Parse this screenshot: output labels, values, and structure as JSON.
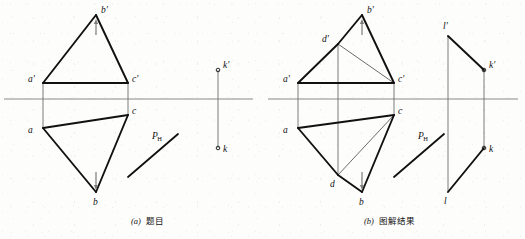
{
  "figure": {
    "type": "descriptive-geometry-projection",
    "width": 525,
    "height": 239,
    "background_color": "#fdfdfc",
    "line_color": "#111111",
    "axis_color": "#8a8a8a",
    "thin_line_color": "#5a5a5a",
    "panels": [
      {
        "id": "panel-a",
        "caption_index": "(a)",
        "caption_text": "题目",
        "caption_position": {
          "x": 131,
          "y": 224
        },
        "ground_line": {
          "x1": 4,
          "y1": 99,
          "x2": 253,
          "y2": 99
        },
        "points": [
          {
            "name": "a-prime",
            "label": "a'",
            "x": 43,
            "y": 83,
            "label_x": 28,
            "label_y": 82,
            "marker": "none"
          },
          {
            "name": "b-prime",
            "label": "b'",
            "x": 96,
            "y": 15,
            "label_x": 101,
            "label_y": 13,
            "marker": "none"
          },
          {
            "name": "c-prime",
            "label": "c'",
            "x": 128,
            "y": 83,
            "label_x": 132,
            "label_y": 82,
            "marker": "none"
          },
          {
            "name": "a",
            "label": "a",
            "x": 43,
            "y": 128,
            "label_x": 28,
            "label_y": 133,
            "marker": "none"
          },
          {
            "name": "b",
            "label": "b",
            "x": 96,
            "y": 192,
            "label_x": 93,
            "label_y": 205,
            "marker": "none"
          },
          {
            "name": "c",
            "label": "c",
            "x": 128,
            "y": 115,
            "label_x": 132,
            "label_y": 114,
            "marker": "none"
          },
          {
            "name": "k-prime",
            "label": "k'",
            "x": 218,
            "y": 70,
            "label_x": 223,
            "label_y": 68,
            "marker": "circle"
          },
          {
            "name": "k",
            "label": "k",
            "x": 218,
            "y": 148,
            "label_x": 223,
            "label_y": 152,
            "marker": "circle"
          }
        ],
        "thick_edges": [
          {
            "name": "edge-a-prime-b-prime",
            "from": "a-prime",
            "to": "b-prime"
          },
          {
            "name": "edge-b-prime-c-prime",
            "from": "b-prime",
            "to": "c-prime"
          },
          {
            "name": "edge-a-prime-c-prime",
            "from": "a-prime",
            "to": "c-prime"
          },
          {
            "name": "edge-a-b",
            "from": "a",
            "to": "b"
          },
          {
            "name": "edge-b-c",
            "from": "b",
            "to": "c"
          },
          {
            "name": "edge-a-c",
            "from": "a",
            "to": "c"
          }
        ],
        "projection_lines": [
          {
            "name": "projector-a",
            "x1": 43,
            "y1": 83,
            "x2": 43,
            "y2": 128
          },
          {
            "name": "projector-c",
            "x1": 128,
            "y1": 83,
            "x2": 128,
            "y2": 115
          },
          {
            "name": "projector-k",
            "x1": 218,
            "y1": 70,
            "x2": 218,
            "y2": 148
          }
        ],
        "arrows": [
          {
            "name": "arrow-b-prime",
            "x1": 96,
            "y1": 35,
            "x2": 96,
            "y2": 19
          },
          {
            "name": "arrow-b",
            "x1": 96,
            "y1": 172,
            "x2": 96,
            "y2": 190
          }
        ],
        "trace_line": {
          "name": "trace-ph",
          "x1": 128,
          "y1": 177,
          "x2": 178,
          "y2": 134,
          "label_main": "P",
          "label_sub": "H",
          "label_x": 152,
          "label_y": 139
        }
      },
      {
        "id": "panel-b",
        "caption_index": "(b)",
        "caption_text": "图解结果",
        "caption_position": {
          "x": 364,
          "y": 224
        },
        "ground_line": {
          "x1": 268,
          "y1": 99,
          "x2": 518,
          "y2": 99
        },
        "points": [
          {
            "name": "a-prime",
            "label": "a'",
            "x": 298,
            "y": 83,
            "label_x": 283,
            "label_y": 82,
            "marker": "none"
          },
          {
            "name": "b-prime",
            "label": "b'",
            "x": 362,
            "y": 15,
            "label_x": 367,
            "label_y": 13,
            "marker": "none"
          },
          {
            "name": "c-prime",
            "label": "c'",
            "x": 394,
            "y": 83,
            "label_x": 398,
            "label_y": 82,
            "marker": "none"
          },
          {
            "name": "d-prime",
            "label": "d'",
            "x": 338,
            "y": 44,
            "label_x": 322,
            "label_y": 42,
            "marker": "none"
          },
          {
            "name": "a",
            "label": "a",
            "x": 298,
            "y": 128,
            "label_x": 283,
            "label_y": 133,
            "marker": "none"
          },
          {
            "name": "b",
            "label": "b",
            "x": 362,
            "y": 192,
            "label_x": 359,
            "label_y": 205,
            "marker": "none"
          },
          {
            "name": "c",
            "label": "c",
            "x": 394,
            "y": 115,
            "label_x": 398,
            "label_y": 114,
            "marker": "none"
          },
          {
            "name": "d",
            "label": "d",
            "x": 338,
            "y": 175,
            "label_x": 330,
            "label_y": 187,
            "marker": "none"
          },
          {
            "name": "l-prime",
            "label": "l'",
            "x": 448,
            "y": 36,
            "label_x": 443,
            "label_y": 29,
            "marker": "none"
          },
          {
            "name": "k-prime",
            "label": "k'",
            "x": 484,
            "y": 70,
            "label_x": 489,
            "label_y": 68,
            "marker": "circle"
          },
          {
            "name": "k",
            "label": "k",
            "x": 484,
            "y": 148,
            "label_x": 489,
            "label_y": 152,
            "marker": "circle"
          },
          {
            "name": "l",
            "label": "l",
            "x": 448,
            "y": 192,
            "label_x": 444,
            "label_y": 204,
            "marker": "none"
          }
        ],
        "thick_edges": [
          {
            "name": "edge-a-prime-d-prime",
            "from": "a-prime",
            "to": "d-prime"
          },
          {
            "name": "edge-d-prime-b-prime",
            "from": "d-prime",
            "to": "b-prime"
          },
          {
            "name": "edge-b-prime-c-prime",
            "from": "b-prime",
            "to": "c-prime"
          },
          {
            "name": "edge-a-prime-c-prime",
            "from": "a-prime",
            "to": "c-prime"
          },
          {
            "name": "edge-a-d",
            "from": "a",
            "to": "d"
          },
          {
            "name": "edge-d-b",
            "from": "d",
            "to": "b"
          },
          {
            "name": "edge-b-c",
            "from": "b",
            "to": "c"
          },
          {
            "name": "edge-a-c",
            "from": "a",
            "to": "c"
          },
          {
            "name": "edge-l-prime-k-prime",
            "from": "l-prime",
            "to": "k-prime"
          },
          {
            "name": "edge-l-k",
            "from": "l",
            "to": "k"
          }
        ],
        "thin_edges": [
          {
            "name": "construction-d-prime-c-prime",
            "from": "d-prime",
            "to": "c-prime"
          },
          {
            "name": "construction-d-c",
            "from": "d",
            "to": "c"
          }
        ],
        "projection_lines": [
          {
            "name": "projector-a",
            "x1": 298,
            "y1": 83,
            "x2": 298,
            "y2": 128
          },
          {
            "name": "projector-c",
            "x1": 394,
            "y1": 83,
            "x2": 394,
            "y2": 115
          },
          {
            "name": "projector-d",
            "x1": 338,
            "y1": 44,
            "x2": 338,
            "y2": 175
          },
          {
            "name": "projector-k",
            "x1": 484,
            "y1": 70,
            "x2": 484,
            "y2": 148
          },
          {
            "name": "projector-l",
            "x1": 448,
            "y1": 36,
            "x2": 448,
            "y2": 192
          }
        ],
        "arrows": [
          {
            "name": "arrow-b-prime",
            "x1": 362,
            "y1": 35,
            "x2": 362,
            "y2": 19
          },
          {
            "name": "arrow-b",
            "x1": 362,
            "y1": 172,
            "x2": 362,
            "y2": 190
          }
        ],
        "trace_line": {
          "name": "trace-ph",
          "x1": 394,
          "y1": 177,
          "x2": 444,
          "y2": 134,
          "label_main": "P",
          "label_sub": "H",
          "label_x": 418,
          "label_y": 139
        }
      }
    ]
  }
}
